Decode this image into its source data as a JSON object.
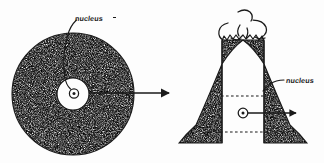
{
  "figure": {
    "background_color": "#fdfdfd",
    "ink_color": "#1a1a1a",
    "width": 324,
    "height": 163
  },
  "labels": {
    "left_nucleus": "nucleus",
    "right_nucleus": "nucleus"
  },
  "left_figure": {
    "name": "stippled-circle",
    "description": "large stipple-filled circle with small white inner circle containing a circled-dot nucleus symbol",
    "center_x": 73,
    "center_y": 94,
    "radius": 61,
    "inner_circle_radius": 16,
    "nucleus_symbol": "circled-dot"
  },
  "right_figure": {
    "name": "volcano-cross-section",
    "description": "volcano cone in cross section with stippled flanks, white central conduit, dashed horizontal magma levels, erupting dashed smoke cloud, and a circled-dot nucleus symbol in the conduit",
    "apex_x": 243,
    "base_y": 143,
    "nucleus_symbol": "circled-dot"
  },
  "connectors": {
    "main_arrow": {
      "name": "transformation-arrow",
      "direction": "right",
      "x_start": 89,
      "x_end": 173,
      "y": 93
    },
    "volcano_arrow": {
      "name": "volcano-nucleus-arrow",
      "direction": "right",
      "x_start": 248,
      "x_end": 297,
      "y": 113
    },
    "left_leader": {
      "name": "left-nucleus-leader-line",
      "from": "label",
      "to": "inner-circle"
    },
    "right_leader": {
      "name": "right-nucleus-leader-line",
      "from": "label",
      "to": "conduit-wall"
    }
  }
}
